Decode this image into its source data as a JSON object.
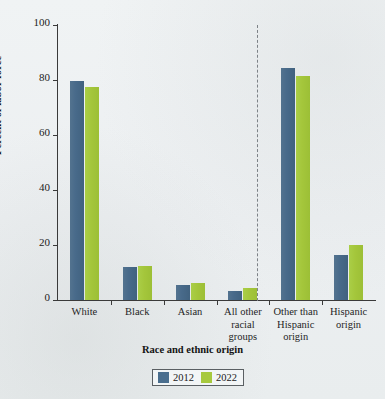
{
  "chart_data": {
    "type": "bar",
    "title": "",
    "xlabel": "Race and ethnic origin",
    "ylabel": "Percent of labor force",
    "ylim": [
      0,
      100
    ],
    "yticks": [
      0,
      20,
      40,
      60,
      80,
      100
    ],
    "ytick_labels": [
      "0",
      "20",
      "40",
      "60",
      "80",
      "100"
    ],
    "grid": false,
    "legend_position": "bottom-center",
    "categories": [
      "White",
      "Black",
      "Asian",
      "All other racial groups",
      "Other than Hispanic origin",
      "Hispanic origin"
    ],
    "category_lines": [
      [
        "White"
      ],
      [
        "Black"
      ],
      [
        "Asian"
      ],
      [
        "All other",
        "racial",
        "groups"
      ],
      [
        "Other than",
        "Hispanic",
        "origin"
      ],
      [
        "Hispanic",
        "origin"
      ]
    ],
    "series": [
      {
        "name": "2012",
        "color": "#4a6e8e",
        "values": [
          79.8,
          12.0,
          5.5,
          3.3,
          84.5,
          16.4
        ]
      },
      {
        "name": "2022",
        "color": "#a7c93e",
        "values": [
          77.6,
          12.4,
          6.3,
          4.2,
          81.6,
          20.0
        ]
      }
    ],
    "annotations": [
      {
        "type": "divider",
        "style": "dashed-vertical",
        "after_category": "All other racial groups"
      }
    ]
  },
  "legend": {
    "items": [
      {
        "label": "2012",
        "color": "#4a6e8e"
      },
      {
        "label": "2022",
        "color": "#a7c93e"
      }
    ]
  },
  "colors": {
    "background": "#eef1f3",
    "axis": "#3a3a3a",
    "divider": "#7d8287",
    "series_2012": "#4a6e8e",
    "series_2022": "#a7c93e"
  }
}
